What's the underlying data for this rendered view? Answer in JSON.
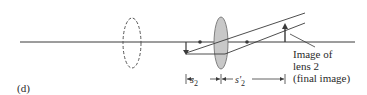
{
  "panel_label": "(d)",
  "caption": {
    "line1": "Image of",
    "line2": "lens 2",
    "line3": "(final image)"
  },
  "dimensions": {
    "s2_symbol": "s",
    "s2_sub": "2",
    "s2p_symbol": "s′",
    "s2p_sub": "2"
  },
  "colors": {
    "line": "#3a3a3a",
    "lens_fill": "#c8c8c8",
    "dashed_lens": "#555555"
  }
}
